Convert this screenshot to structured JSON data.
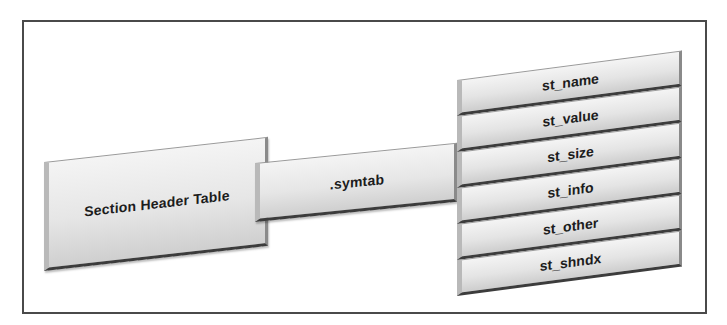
{
  "diagram": {
    "section_header_table": {
      "label": "Section Header Table"
    },
    "symtab": {
      "label": ".symtab"
    },
    "symbol_fields": [
      {
        "label": "st_name"
      },
      {
        "label": "st_value"
      },
      {
        "label": "st_size"
      },
      {
        "label": "st_info"
      },
      {
        "label": "st_other"
      },
      {
        "label": "st_shndx"
      }
    ]
  },
  "colors": {
    "frame_border": "#4a4a4a",
    "slab_fill_top": "#f4f4f4",
    "slab_fill_bottom": "#cfcfcf",
    "slab_edge_dark": "#3c3c3c",
    "text": "#1c1c1c"
  }
}
